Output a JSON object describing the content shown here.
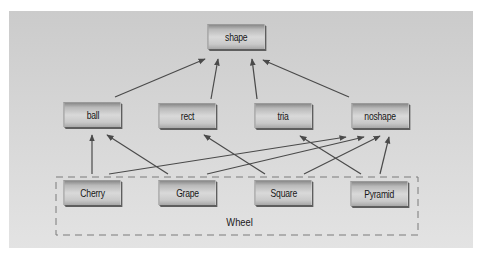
{
  "diagram": {
    "type": "class-hierarchy",
    "background_color": "#d3d3d3",
    "node_text_color": "#161616",
    "edge_color": "#4a4a4a",
    "nodes": {
      "shape": {
        "label": "shape",
        "x": 205,
        "y": 24
      },
      "ball": {
        "label": "ball",
        "x": 61,
        "y": 102
      },
      "rect": {
        "label": "rect",
        "x": 156,
        "y": 103
      },
      "tria": {
        "label": "tria",
        "x": 252,
        "y": 103
      },
      "noshape": {
        "label": "noshape",
        "x": 349,
        "y": 103
      },
      "cherry": {
        "label": "Cherry",
        "x": 61,
        "y": 180
      },
      "grape": {
        "label": "Grape",
        "x": 156,
        "y": 180
      },
      "square": {
        "label": "Square",
        "x": 252,
        "y": 180
      },
      "pyramid": {
        "label": "Pyramid",
        "x": 348,
        "y": 181
      }
    },
    "group": {
      "label": "Wheel",
      "members": [
        "Cherry",
        "Grape",
        "Square",
        "Pyramid"
      ],
      "style": "dashed"
    },
    "edges": [
      {
        "from": "ball",
        "to": "shape"
      },
      {
        "from": "rect",
        "to": "shape"
      },
      {
        "from": "tria",
        "to": "shape"
      },
      {
        "from": "noshape",
        "to": "shape"
      },
      {
        "from": "Cherry",
        "to": "ball"
      },
      {
        "from": "Cherry",
        "to": "noshape"
      },
      {
        "from": "Grape",
        "to": "ball"
      },
      {
        "from": "Grape",
        "to": "noshape"
      },
      {
        "from": "Square",
        "to": "rect"
      },
      {
        "from": "Square",
        "to": "noshape"
      },
      {
        "from": "Pyramid",
        "to": "tria"
      },
      {
        "from": "Pyramid",
        "to": "noshape"
      }
    ]
  }
}
